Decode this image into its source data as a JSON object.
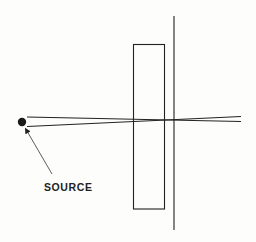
{
  "diagram": {
    "source_label": "SOURCE",
    "colors": {
      "background": "#fdfdfc",
      "ink": "#222222"
    },
    "elements": {
      "source": {
        "cx": 22,
        "cy": 122,
        "r": 4.2
      },
      "ray_upper": {
        "x1": 27,
        "y1": 117,
        "x2": 241,
        "y2": 121.5
      },
      "ray_lower": {
        "x1": 27,
        "y1": 126.5,
        "x2": 241,
        "y2": 116.5
      },
      "slab": {
        "x": 133.5,
        "y": 44.5,
        "width": 31,
        "height": 164.5
      },
      "screen": {
        "x": 174,
        "y1": 16,
        "y2": 230
      },
      "pointer_arrow": {
        "x1": 52,
        "y1": 174,
        "x2": 25,
        "y2": 128
      }
    }
  }
}
